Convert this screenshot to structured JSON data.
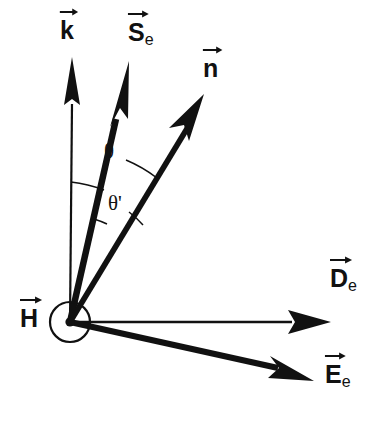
{
  "figure": {
    "type": "vector-diagram",
    "background_color": "#ffffff",
    "stroke_color": "#111111",
    "title": ""
  },
  "origin": {
    "x": 70,
    "y": 322,
    "marker": "dot-in-circle",
    "circle_radius": 20,
    "dot_radius": 4.5
  },
  "vectors": [
    {
      "id": "k",
      "label_base": "k",
      "label_sub": "",
      "label_x": 60,
      "label_y": 18,
      "tip_x": 72,
      "tip_y": 58,
      "style": "thin",
      "arrow": "narrow"
    },
    {
      "id": "S_e",
      "label_base": "S",
      "label_sub": "e",
      "label_x": 128,
      "label_y": 20,
      "tip_x": 129,
      "tip_y": 62,
      "style": "thick",
      "arrow": "long-narrow"
    },
    {
      "id": "n",
      "label_base": "n",
      "label_sub": "",
      "label_x": 203,
      "label_y": 56,
      "tip_x": 204,
      "tip_y": 94,
      "style": "thick",
      "arrow": "long-narrow"
    },
    {
      "id": "D_e",
      "label_base": "D",
      "label_sub": "e",
      "label_x": 330,
      "label_y": 266,
      "tip_x": 331,
      "tip_y": 322,
      "style": "thin",
      "arrow": "wide"
    },
    {
      "id": "E_e",
      "label_base": "E",
      "label_sub": "e",
      "label_x": 325,
      "label_y": 362,
      "tip_x": 314,
      "tip_y": 381,
      "style": "thick",
      "arrow": "wide"
    },
    {
      "id": "H",
      "label_base": "H",
      "label_sub": "",
      "label_x": 20,
      "label_y": 306,
      "tip_x": null,
      "tip_y": null,
      "style": "out-of-page",
      "arrow": "none"
    }
  ],
  "angles": [
    {
      "id": "theta",
      "label": "θ",
      "label_x": 104,
      "label_y": 141,
      "from_vector": "k",
      "to_vector": "n",
      "arc_radius": 140
    },
    {
      "id": "theta_prime",
      "label": "θ'",
      "label_x": 108,
      "label_y": 193,
      "from_vector": "S_e",
      "to_vector": "n",
      "arc_radius": 105
    }
  ]
}
